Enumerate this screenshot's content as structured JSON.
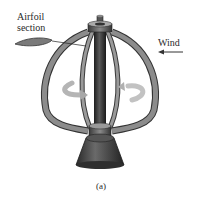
{
  "figure": {
    "labels": {
      "airfoil_line1": "Airfoil",
      "airfoil_line2": "section",
      "wind": "Wind",
      "caption": "(a)"
    },
    "annotations": {
      "wind_arrow_direction": "left",
      "rotation_arrows": "curved arrows around central shaft indicating rotation"
    },
    "colors": {
      "blade": "#8a8a8a",
      "blade_edge": "#3a3a3a",
      "shaft": "#2e2e2e",
      "base": "#3c3c3c",
      "rotation_arrow": "#b8b8b8",
      "text": "#2a2a2a"
    }
  }
}
